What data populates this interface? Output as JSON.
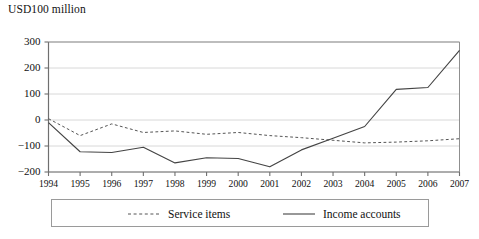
{
  "chart_data": {
    "type": "line",
    "title": "USD100 million",
    "subtitle": "",
    "xlabel": "",
    "ylabel": "USD100 million",
    "categories": [
      "1994",
      "1995",
      "1996",
      "1997",
      "1998",
      "1999",
      "2000",
      "2001",
      "2002",
      "2003",
      "2004",
      "2005",
      "2006",
      "2007"
    ],
    "x": [
      1994,
      1995,
      1996,
      1997,
      1998,
      1999,
      2000,
      2001,
      2002,
      2003,
      2004,
      2005,
      2006,
      2007
    ],
    "ylim": [
      -200,
      300
    ],
    "yticks": [
      300,
      200,
      100,
      0,
      -100,
      -200
    ],
    "ytick_labels": [
      "300",
      "200",
      "100",
      "0",
      "−100",
      "−200"
    ],
    "grid": true,
    "grid_axis": "y",
    "legend_position": "bottom",
    "series": [
      {
        "name": "Service items",
        "style": "dashed",
        "color": "#555555",
        "values": [
          5,
          -60,
          -15,
          -48,
          -42,
          -55,
          -48,
          -60,
          -68,
          -78,
          -88,
          -85,
          -80,
          -72
        ]
      },
      {
        "name": "Income accounts",
        "style": "solid",
        "color": "#444444",
        "values": [
          -10,
          -122,
          -125,
          -105,
          -165,
          -145,
          -148,
          -180,
          -115,
          -70,
          -25,
          118,
          125,
          268
        ]
      }
    ]
  },
  "legend": {
    "items": [
      {
        "label": "Service items",
        "style": "dashed"
      },
      {
        "label": "Income accounts",
        "style": "solid"
      }
    ]
  },
  "colors": {
    "axis": "#6f6f6f",
    "grid": "#d8d8d8",
    "frame": "#8f8f8f",
    "series_dashed": "#555555",
    "series_solid": "#444444",
    "text": "#111111"
  }
}
